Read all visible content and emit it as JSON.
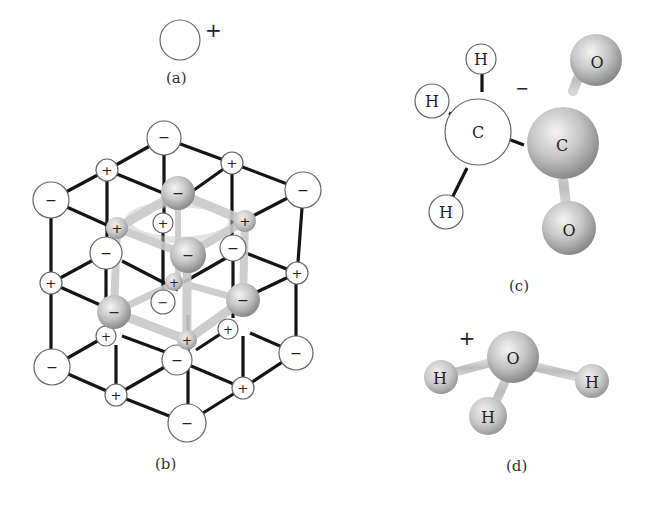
{
  "figure": {
    "panels": [
      {
        "id": "a",
        "label": "(a)",
        "description": "Single positive ion",
        "charge": "+"
      },
      {
        "id": "b",
        "label": "(b)",
        "description": "Ionic crystal lattice of alternating positive and negative ions with a highlighted unit",
        "ion_symbols": {
          "positive": "+",
          "negative": "−"
        }
      },
      {
        "id": "c",
        "label": "(c)",
        "description": "Acetate ion (CH3COO−)",
        "charge": "−",
        "atoms": {
          "h1": "H",
          "h2": "H",
          "h3": "H",
          "c1": "C",
          "c2": "C",
          "o1": "O",
          "o2": "O"
        }
      },
      {
        "id": "d",
        "label": "(d)",
        "description": "Hydronium ion (H3O+)",
        "charge": "+",
        "atoms": {
          "o": "O",
          "h1": "H",
          "h2": "H",
          "h3": "H"
        }
      }
    ]
  },
  "colors": {
    "bond": "#151515",
    "outline": "#666666",
    "sphere_light": "#f2f2f2",
    "sphere_dark": "#8c8c8c",
    "text": "#222222"
  }
}
